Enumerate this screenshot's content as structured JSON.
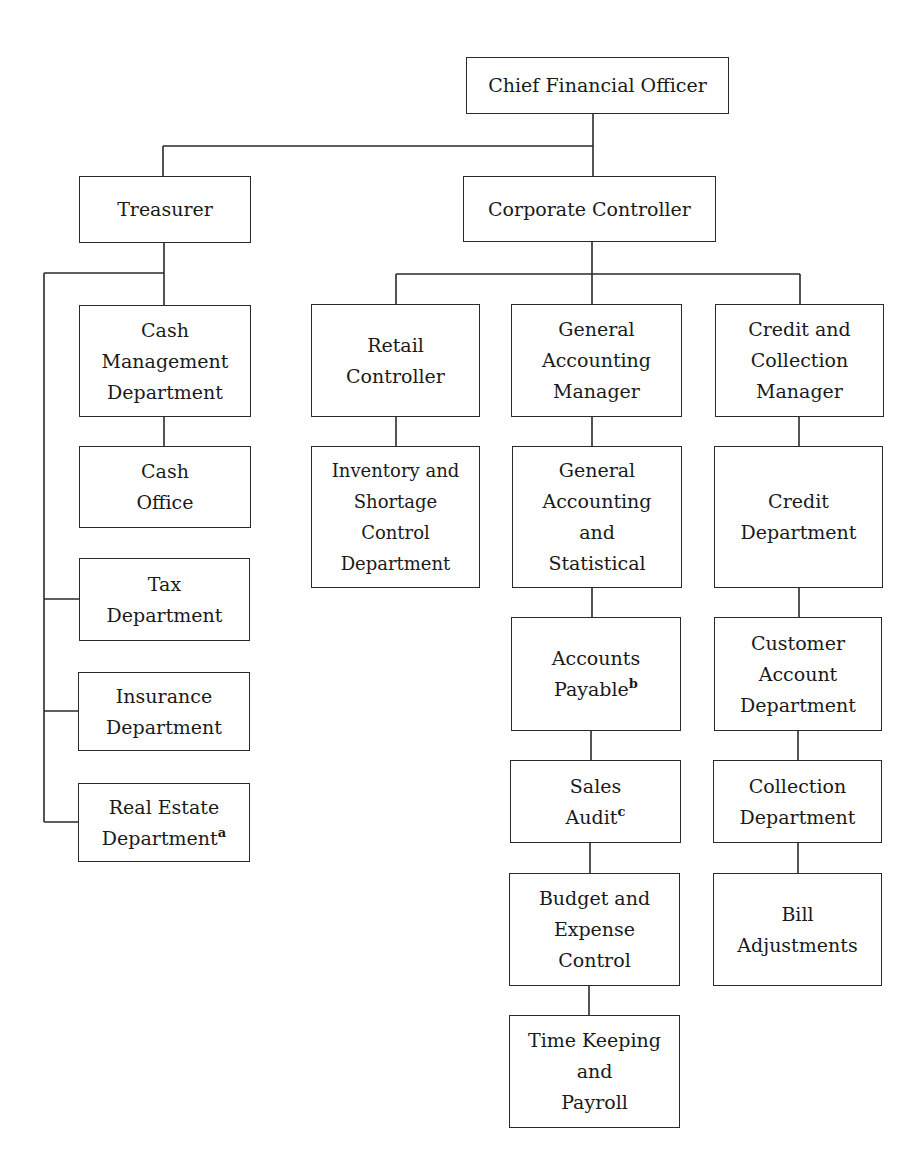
{
  "chart": {
    "title": "",
    "nodes": {
      "cfo": {
        "label": "Chief Financial Officer"
      },
      "treasurer": {
        "label": "Treasurer"
      },
      "corporate_controller": {
        "label": "Corporate Controller"
      },
      "cash_management": {
        "label": "Cash\nManagement\nDepartment"
      },
      "cash_office": {
        "label": "Cash\nOffice"
      },
      "tax": {
        "label": "Tax\nDepartment"
      },
      "insurance": {
        "label": "Insurance\nDepartment"
      },
      "real_estate": {
        "label": "Real Estate\nDepartment",
        "footnote": "a"
      },
      "retail_controller": {
        "label": "Retail\nController"
      },
      "inventory": {
        "label": "Inventory and\nShortage\nControl\nDepartment"
      },
      "gen_acct_manager": {
        "label": "General\nAccounting\nManager"
      },
      "gen_acct_stat": {
        "label": "General\nAccounting\nand\nStatistical"
      },
      "accounts_payable": {
        "label": "Accounts\nPayable",
        "footnote": "b"
      },
      "sales_audit": {
        "label": "Sales\nAudit",
        "footnote": "c"
      },
      "budget": {
        "label": "Budget and\nExpense\nControl"
      },
      "timekeeping": {
        "label": "Time Keeping\nand\nPayroll"
      },
      "credit_collection_manager": {
        "label": "Credit and\nCollection\nManager"
      },
      "credit_dept": {
        "label": "Credit\nDepartment"
      },
      "customer_account": {
        "label": "Customer\nAccount\nDepartment"
      },
      "collection_dept": {
        "label": "Collection\nDepartment"
      },
      "bill_adjustments": {
        "label": "Bill\nAdjustments"
      }
    },
    "edges": [
      [
        "cfo",
        "treasurer"
      ],
      [
        "cfo",
        "corporate_controller"
      ],
      [
        "treasurer",
        "cash_management"
      ],
      [
        "cash_management",
        "cash_office"
      ],
      [
        "treasurer",
        "tax"
      ],
      [
        "treasurer",
        "insurance"
      ],
      [
        "treasurer",
        "real_estate"
      ],
      [
        "corporate_controller",
        "retail_controller"
      ],
      [
        "corporate_controller",
        "gen_acct_manager"
      ],
      [
        "corporate_controller",
        "credit_collection_manager"
      ],
      [
        "retail_controller",
        "inventory"
      ],
      [
        "gen_acct_manager",
        "gen_acct_stat"
      ],
      [
        "gen_acct_stat",
        "accounts_payable"
      ],
      [
        "accounts_payable",
        "sales_audit"
      ],
      [
        "sales_audit",
        "budget"
      ],
      [
        "budget",
        "timekeeping"
      ],
      [
        "credit_collection_manager",
        "credit_dept"
      ],
      [
        "credit_dept",
        "customer_account"
      ],
      [
        "customer_account",
        "collection_dept"
      ],
      [
        "collection_dept",
        "bill_adjustments"
      ]
    ]
  }
}
